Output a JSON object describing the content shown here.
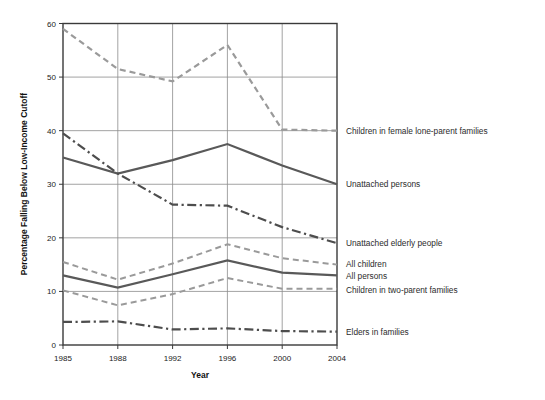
{
  "chart_data": {
    "type": "line",
    "title": "",
    "xlabel": "Year",
    "ylabel": "Percentage Falling Below Low-Income Cutoff",
    "x": [
      1985,
      1988,
      1992,
      1996,
      2000,
      2004
    ],
    "xtick_labels": [
      "1985",
      "1988",
      "1992",
      "1996",
      "2000",
      "2004"
    ],
    "ytick_labels": [
      "0",
      "10",
      "20",
      "30",
      "40",
      "50",
      "60"
    ],
    "yticks": [
      0,
      10,
      20,
      30,
      40,
      50,
      60
    ],
    "ylim": [
      0,
      60
    ],
    "grid": "both",
    "legend_position": "right-inline-labels",
    "series": [
      {
        "name": "Children in female lone-parent families",
        "values": [
          59.0,
          51.5,
          49.2,
          56.0,
          40.2,
          40.0
        ],
        "style": "dashed",
        "color": "#9a9a9a",
        "width": 2.2,
        "label_y": 40.0
      },
      {
        "name": "Unattached persons",
        "values": [
          35.0,
          32.0,
          34.5,
          37.5,
          33.5,
          30.0
        ],
        "style": "solid",
        "color": "#595959",
        "width": 2.2,
        "label_y": 30.0
      },
      {
        "name": "Unattached elderly people",
        "values": [
          39.5,
          32.0,
          26.2,
          26.0,
          22.0,
          19.0
        ],
        "style": "dashdot",
        "color": "#4d4d4d",
        "width": 2.2,
        "label_y": 19.0
      },
      {
        "name": "All children",
        "values": [
          15.5,
          12.2,
          15.2,
          18.8,
          16.2,
          15.0
        ],
        "style": "dashed",
        "color": "#9a9a9a",
        "width": 2.0,
        "label_y": 15.0
      },
      {
        "name": "All persons",
        "values": [
          13.0,
          10.7,
          13.2,
          15.8,
          13.5,
          13.0
        ],
        "style": "solid",
        "color": "#595959",
        "width": 2.2,
        "label_y": 13.0
      },
      {
        "name": "Children in two-parent families",
        "values": [
          10.2,
          7.4,
          9.5,
          12.5,
          10.5,
          10.5
        ],
        "style": "dashed",
        "color": "#9a9a9a",
        "width": 2.0,
        "label_y": 10.5
      },
      {
        "name": "Elders in families",
        "values": [
          4.3,
          4.4,
          2.9,
          3.1,
          2.6,
          2.5
        ],
        "style": "dashdot",
        "color": "#4d4d4d",
        "width": 2.2,
        "label_y": 2.5
      }
    ]
  },
  "axes": {
    "ylabel": "Percentage Falling Below Low-Income Cutoff",
    "xlabel": "Year"
  }
}
